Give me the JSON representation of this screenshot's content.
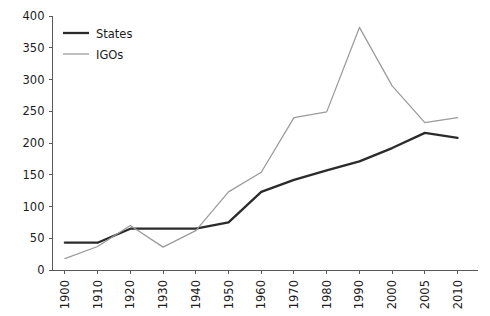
{
  "chart_data": {
    "type": "line",
    "title": "",
    "subtitle": "",
    "xlabel": "",
    "ylabel": "",
    "categories": [
      "1900",
      "1910",
      "1920",
      "1930",
      "1940",
      "1950",
      "1960",
      "1970",
      "1980",
      "1990",
      "2000",
      "2005",
      "2010"
    ],
    "series": [
      {
        "name": "States",
        "color": "#2b2b2b",
        "values": [
          43,
          43,
          65,
          65,
          65,
          75,
          123,
          142,
          157,
          171,
          192,
          216,
          208
        ]
      },
      {
        "name": "IGOs",
        "color": "#9a9a9a",
        "values": [
          18,
          37,
          70,
          36,
          62,
          123,
          154,
          240,
          249,
          382,
          290,
          232,
          240
        ]
      }
    ],
    "ylim": [
      0,
      400
    ],
    "yticks": [
      0,
      50,
      100,
      150,
      200,
      250,
      300,
      350,
      400
    ],
    "ytick_labels": [
      "0",
      "50",
      "100",
      "150",
      "200",
      "250",
      "300",
      "350",
      "400"
    ],
    "grid": false,
    "legend_position": "top-left",
    "legend": [
      {
        "label": "States",
        "icon": "line-swatch-dark"
      },
      {
        "label": "IGOs",
        "icon": "line-swatch-gray"
      }
    ],
    "colors": {
      "states": "#2b2b2b",
      "igos": "#9a9a9a",
      "axis": "#595959",
      "background": "#ffffff"
    }
  }
}
